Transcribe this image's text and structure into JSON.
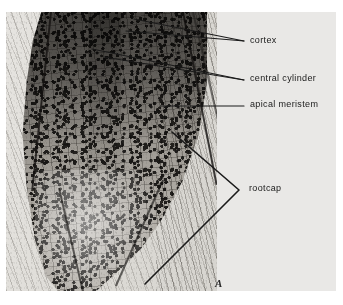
{
  "figure": {
    "plate_letter": "A",
    "caption_subject": "root tip longitudinal section micrograph",
    "background_color": "#ffffff",
    "plate_color": "#e9e8e6",
    "annotation_color": "#1a1a1a"
  },
  "annotations": [
    {
      "id": "cortex",
      "label": "cortex",
      "label_x": 250,
      "label_y": 38,
      "leader_type": "multi-line",
      "targets": [
        [
          134,
          19
        ],
        [
          126,
          30
        ]
      ],
      "anchor": [
        244,
        41
      ]
    },
    {
      "id": "central-cylinder",
      "label": "central cylinder",
      "label_x": 250,
      "label_y": 76,
      "leader_type": "multi-line",
      "targets": [
        [
          92,
          49
        ],
        [
          104,
          56
        ]
      ],
      "anchor": [
        244,
        80
      ]
    },
    {
      "id": "apical-meristem",
      "label": "apical meristem",
      "label_x": 250,
      "label_y": 102,
      "leader_type": "single-line",
      "targets": [
        [
          161,
          106
        ]
      ],
      "anchor": [
        244,
        106
      ]
    },
    {
      "id": "rootcap",
      "label": "rootcap",
      "label_x": 249,
      "label_y": 186,
      "leader_type": "bracket",
      "targets": [
        [
          172,
          132
        ],
        [
          145,
          284
        ]
      ],
      "anchor": [
        239,
        190
      ]
    }
  ]
}
